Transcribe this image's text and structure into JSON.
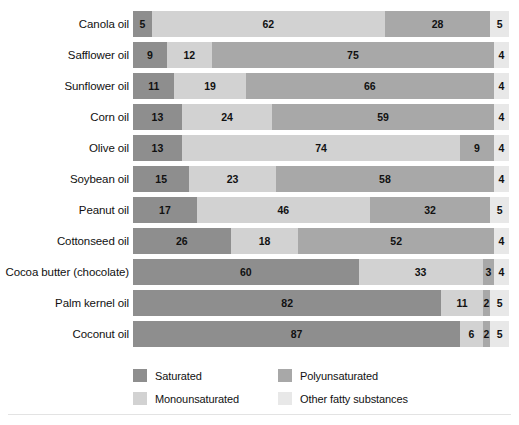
{
  "chart_data": {
    "type": "bar",
    "subtype": "horizontal-stacked-100",
    "title": "",
    "xlabel": "",
    "ylabel": "",
    "xlim": [
      0,
      100
    ],
    "grid": false,
    "legend_position": "bottom",
    "units": "percent",
    "categories": [
      "Canola oil",
      "Safflower oil",
      "Sunflower oil",
      "Corn oil",
      "Olive oil",
      "Soybean oil",
      "Peanut oil",
      "Cottonseed oil",
      "Cocoa butter (chocolate)",
      "Palm kernel oil",
      "Coconut oil"
    ],
    "series": [
      {
        "name": "Saturated",
        "color": "#8e8e8e",
        "values": [
          5,
          9,
          11,
          13,
          13,
          15,
          17,
          26,
          60,
          82,
          87
        ]
      },
      {
        "name": "Monounsaturated",
        "color": "#d2d2d2",
        "values": [
          62,
          12,
          19,
          24,
          74,
          23,
          46,
          18,
          33,
          11,
          6
        ]
      },
      {
        "name": "Polyunsaturated",
        "color": "#a8a8a8",
        "values": [
          28,
          75,
          66,
          59,
          9,
          58,
          32,
          52,
          3,
          2,
          2
        ]
      },
      {
        "name": "Other fatty substances",
        "color": "#e8e8e8",
        "values": [
          5,
          4,
          4,
          4,
          4,
          4,
          5,
          4,
          4,
          5,
          5
        ]
      }
    ],
    "rows": [
      {
        "label": "Canola oil",
        "segments": [
          {
            "key": "sat",
            "value": 5
          },
          {
            "key": "mono",
            "value": 62
          },
          {
            "key": "poly",
            "value": 28
          },
          {
            "key": "other",
            "value": 5
          }
        ]
      },
      {
        "label": "Safflower oil",
        "segments": [
          {
            "key": "sat",
            "value": 9
          },
          {
            "key": "mono",
            "value": 12
          },
          {
            "key": "poly",
            "value": 75
          },
          {
            "key": "other",
            "value": 4
          }
        ]
      },
      {
        "label": "Sunflower oil",
        "segments": [
          {
            "key": "sat",
            "value": 11
          },
          {
            "key": "mono",
            "value": 19
          },
          {
            "key": "poly",
            "value": 66
          },
          {
            "key": "other",
            "value": 4
          }
        ]
      },
      {
        "label": "Corn oil",
        "segments": [
          {
            "key": "sat",
            "value": 13
          },
          {
            "key": "mono",
            "value": 24
          },
          {
            "key": "poly",
            "value": 59
          },
          {
            "key": "other",
            "value": 4
          }
        ]
      },
      {
        "label": "Olive oil",
        "segments": [
          {
            "key": "sat",
            "value": 13
          },
          {
            "key": "mono",
            "value": 74
          },
          {
            "key": "poly",
            "value": 9
          },
          {
            "key": "other",
            "value": 4
          }
        ]
      },
      {
        "label": "Soybean oil",
        "segments": [
          {
            "key": "sat",
            "value": 15
          },
          {
            "key": "mono",
            "value": 23
          },
          {
            "key": "poly",
            "value": 58
          },
          {
            "key": "other",
            "value": 4
          }
        ]
      },
      {
        "label": "Peanut oil",
        "segments": [
          {
            "key": "sat",
            "value": 17
          },
          {
            "key": "mono",
            "value": 46
          },
          {
            "key": "poly",
            "value": 32
          },
          {
            "key": "other",
            "value": 5
          }
        ]
      },
      {
        "label": "Cottonseed oil",
        "segments": [
          {
            "key": "sat",
            "value": 26
          },
          {
            "key": "mono",
            "value": 18
          },
          {
            "key": "poly",
            "value": 52
          },
          {
            "key": "other",
            "value": 4
          }
        ]
      },
      {
        "label": "Cocoa butter (chocolate)",
        "segments": [
          {
            "key": "sat",
            "value": 60
          },
          {
            "key": "mono",
            "value": 33
          },
          {
            "key": "poly",
            "value": 3
          },
          {
            "key": "other",
            "value": 4
          }
        ]
      },
      {
        "label": "Palm kernel oil",
        "segments": [
          {
            "key": "sat",
            "value": 82
          },
          {
            "key": "mono",
            "value": 11
          },
          {
            "key": "poly",
            "value": 2
          },
          {
            "key": "other",
            "value": 5
          }
        ]
      },
      {
        "label": "Coconut oil",
        "segments": [
          {
            "key": "sat",
            "value": 87
          },
          {
            "key": "mono",
            "value": 6
          },
          {
            "key": "poly",
            "value": 2
          },
          {
            "key": "other",
            "value": 5
          }
        ]
      }
    ],
    "legend": [
      {
        "key": "sat",
        "label": "Saturated",
        "color": "#8e8e8e"
      },
      {
        "key": "poly",
        "label": "Polyunsaturated",
        "color": "#a8a8a8"
      },
      {
        "key": "mono",
        "label": "Monounsaturated",
        "color": "#d2d2d2"
      },
      {
        "key": "other",
        "label": "Other fatty substances",
        "color": "#e8e8e8"
      }
    ]
  }
}
